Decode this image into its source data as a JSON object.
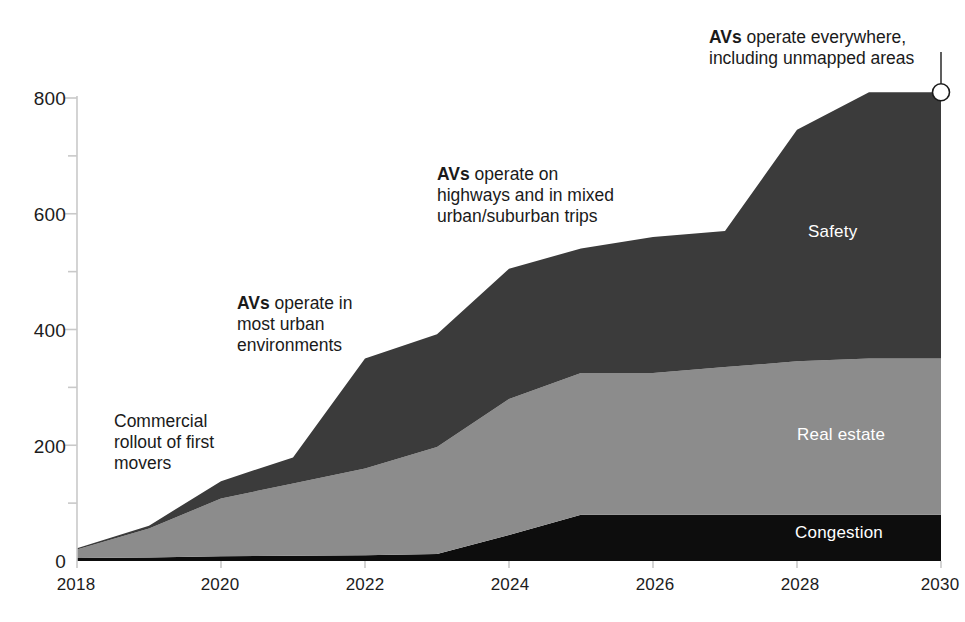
{
  "chart_data": {
    "type": "area",
    "stacked": true,
    "title": "",
    "xlabel": "",
    "ylabel": "",
    "x": [
      2018,
      2019,
      2020,
      2021,
      2022,
      2023,
      2024,
      2025,
      2026,
      2027,
      2028,
      2029,
      2030
    ],
    "xlim": [
      2018,
      2030
    ],
    "ylim": [
      0,
      830
    ],
    "yticks_major": [
      0,
      200,
      400,
      600,
      800
    ],
    "yticks_minor": [
      100,
      300,
      500,
      700
    ],
    "xticks": [
      2018,
      2020,
      2022,
      2024,
      2026,
      2028,
      2030
    ],
    "grid": false,
    "legend_position": "inline-right",
    "series": [
      {
        "name": "Congestion",
        "color": "#0d0d0d",
        "label_color": "#ffffff",
        "values": [
          5,
          6,
          8,
          9,
          10,
          12,
          45,
          80,
          80,
          80,
          80,
          80,
          80
        ]
      },
      {
        "name": "Real estate",
        "color": "#8c8c8c",
        "label_color": "#ffffff",
        "values": [
          15,
          50,
          100,
          125,
          150,
          185,
          235,
          245,
          245,
          255,
          265,
          270,
          270
        ]
      },
      {
        "name": "Safety",
        "color": "#3b3b3b",
        "label_color": "#ffffff",
        "values": [
          2,
          5,
          30,
          45,
          190,
          195,
          225,
          215,
          235,
          235,
          400,
          460,
          460
        ]
      }
    ],
    "totals": [
      22,
      61,
      138,
      179,
      350,
      392,
      505,
      540,
      560,
      570,
      745,
      810,
      810
    ],
    "end_marker": {
      "x": 2030,
      "y": 810,
      "shape": "circle",
      "fill": "#ffffff",
      "stroke": "#1a1a1a"
    }
  },
  "axis": {
    "y_labels": [
      "800",
      "600",
      "400",
      "200",
      "0"
    ],
    "x_labels": [
      "2018",
      "2020",
      "2022",
      "2024",
      "2026",
      "2028",
      "2030"
    ]
  },
  "series_labels": [
    {
      "key": "safety",
      "text": "Safety"
    },
    {
      "key": "real-estate",
      "text": "Real estate"
    },
    {
      "key": "congestion",
      "text": "Congestion"
    }
  ],
  "annotations": [
    {
      "key": "commercial-rollout",
      "lead": "",
      "text": "Commercial\nrollout of first\nmovers"
    },
    {
      "key": "avs-urban",
      "lead": "AVs",
      "text": " operate in\nmost urban\nenvironments"
    },
    {
      "key": "avs-highways",
      "lead": "AVs",
      "text": " operate on\nhighways and in mixed\nurban/suburban trips"
    },
    {
      "key": "avs-everywhere",
      "lead": "AVs",
      "text": " operate everywhere,\nincluding unmapped areas"
    }
  ],
  "colors": {
    "congestion": "#0d0d0d",
    "real_estate": "#8c8c8c",
    "safety": "#3b3b3b",
    "axis": "#c9c9c9",
    "text": "#1a1a1a",
    "background": "#ffffff"
  }
}
